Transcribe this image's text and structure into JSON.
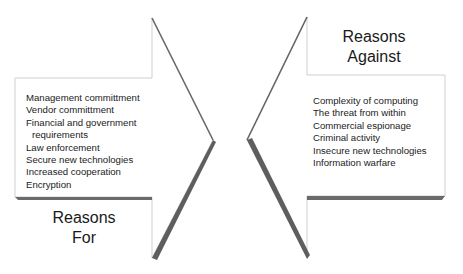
{
  "diagram": {
    "type": "opposing-arrows",
    "colors": {
      "outline": "#c8c8c8",
      "shadow": "#5a5a5a",
      "fill": "#ffffff",
      "text": "#222222"
    },
    "left_arrow": {
      "title_line1": "Reasons",
      "title_line2": "For",
      "items": [
        "Management committment",
        "Vendor committment",
        "Financial and government",
        "requirements",
        "Law enforcement",
        "Secure new technologies",
        "Increased cooperation",
        "Encryption"
      ]
    },
    "right_arrow": {
      "title_line1": "Reasons",
      "title_line2": "Against",
      "items": [
        "Complexity of computing",
        "The threat from within",
        "Commercial espionage",
        "Criminal activity",
        "Insecure new technologies",
        "Information warfare"
      ]
    }
  }
}
